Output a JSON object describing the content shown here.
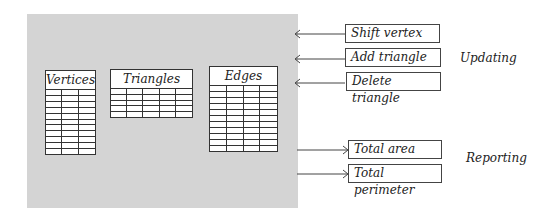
{
  "diagram": {
    "panel_color": "#d4d4d4",
    "tables": [
      {
        "name": "Vertices",
        "rows": 11,
        "cols": 3
      },
      {
        "name": "Triangles",
        "rows": 5,
        "cols": 5
      },
      {
        "name": "Edges",
        "rows": 11,
        "cols": 4
      }
    ],
    "updating": {
      "label": "Updating",
      "operations": [
        "Shift vertex",
        "Add triangle",
        "Delete triangle"
      ]
    },
    "reporting": {
      "label": "Reporting",
      "operations": [
        "Total area",
        "Total perimeter"
      ]
    }
  }
}
